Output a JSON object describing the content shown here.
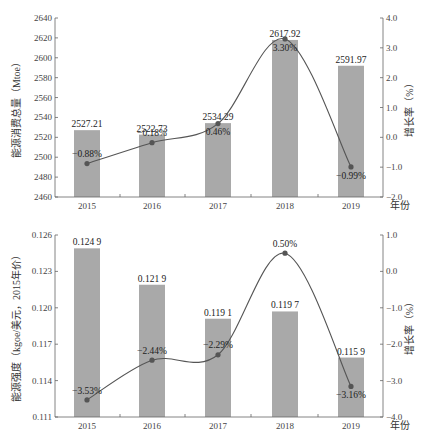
{
  "chart_data": [
    {
      "type": "bar+line",
      "categories": [
        "2015",
        "2016",
        "2017",
        "2018",
        "2019"
      ],
      "xlabel": "年份",
      "ylabel": "能源消费总量（Mtoe）",
      "y2label": "增长率（%）",
      "ylim": [
        2460,
        2640
      ],
      "y_ticks": [
        "2460",
        "2480",
        "2500",
        "2520",
        "2540",
        "2560",
        "2580",
        "2600",
        "2620",
        "2640"
      ],
      "y2lim": [
        -2.0,
        4.0
      ],
      "y2_ticks": [
        "-2.0",
        "-1.0",
        "0.0",
        "1.0",
        "2.0",
        "3.0",
        "4.0"
      ],
      "series": [
        {
          "name": "能源消费总量",
          "kind": "bar",
          "axis": "left",
          "values": [
            2527.21,
            2522.73,
            2534.29,
            2617.92,
            2591.97
          ],
          "labels": [
            "2527.21",
            "2522.73",
            "2534.29",
            "2617.92",
            "2591.97"
          ]
        },
        {
          "name": "增长率",
          "kind": "line",
          "axis": "right",
          "values": [
            -0.88,
            -0.18,
            0.46,
            3.3,
            -0.99
          ],
          "labels": [
            "-0.88%",
            "-0.18%",
            "0.46%",
            "3.30%",
            "-0.99%"
          ]
        }
      ]
    },
    {
      "type": "bar+line",
      "categories": [
        "2015",
        "2016",
        "2017",
        "2018",
        "2019"
      ],
      "xlabel": "年份",
      "ylabel": "能源强度（kgoe/美元，2015年价）",
      "y2label": "增长率（%）",
      "ylim": [
        0.111,
        0.126
      ],
      "y_ticks": [
        "0.111",
        "0.114",
        "0.117",
        "0.120",
        "0.123",
        "0.126"
      ],
      "y2lim": [
        -4.0,
        1.0
      ],
      "y2_ticks": [
        "-4.0",
        "-3.0",
        "-2.0",
        "-1.0",
        "0.0",
        "1.0"
      ],
      "series": [
        {
          "name": "能源强度",
          "kind": "bar",
          "axis": "left",
          "values": [
            0.1249,
            0.1219,
            0.1191,
            0.1197,
            0.1159
          ],
          "labels": [
            "0.124 9",
            "0.121 9",
            "0.119 1",
            "0.119 7",
            "0.115 9"
          ]
        },
        {
          "name": "增长率",
          "kind": "line",
          "axis": "right",
          "values": [
            -3.53,
            -2.44,
            -2.29,
            0.5,
            -3.16
          ],
          "labels": [
            "-3.53%",
            "-2.44%",
            "-2.29%",
            "0.50%",
            "-3.16%"
          ]
        }
      ]
    }
  ]
}
